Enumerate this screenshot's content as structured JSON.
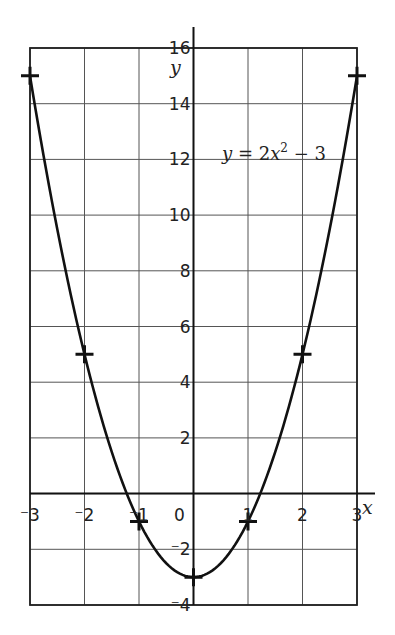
{
  "chart_data": {
    "type": "line",
    "title": "",
    "equation": "y = 2x² − 3",
    "equation_parts": {
      "lhs": "y",
      "eq": " = 2",
      "var": "x",
      "exp": "2",
      "rest": " − 3"
    },
    "xlabel": "x",
    "ylabel": "y",
    "xlim": [
      -3,
      3
    ],
    "ylim": [
      -4,
      16
    ],
    "grid": true,
    "x_ticks": [
      -3,
      -2,
      -1,
      0,
      1,
      2,
      3
    ],
    "x_tick_labels": [
      "⁻3",
      "⁻2",
      "⁻1",
      "0",
      "1",
      "2",
      "3"
    ],
    "y_ticks": [
      -4,
      -2,
      2,
      4,
      6,
      8,
      10,
      12,
      14,
      16
    ],
    "y_tick_labels": [
      "⁻4",
      "⁻2",
      "2",
      "4",
      "6",
      "8",
      "10",
      "12",
      "14",
      "16"
    ],
    "plotted_points": [
      {
        "x": -3,
        "y": 15
      },
      {
        "x": -2,
        "y": 5
      },
      {
        "x": -1,
        "y": -1
      },
      {
        "x": 0,
        "y": -3
      },
      {
        "x": 1,
        "y": -1
      },
      {
        "x": 2,
        "y": 5
      },
      {
        "x": 3,
        "y": 15
      }
    ],
    "series": [
      {
        "name": "y = 2x^2 - 3",
        "x": [
          -3,
          -2,
          -1,
          0,
          1,
          2,
          3
        ],
        "values": [
          15,
          5,
          -1,
          -3,
          -1,
          5,
          15
        ]
      }
    ]
  },
  "labels": {
    "x_axis": "x",
    "y_axis": "y"
  }
}
